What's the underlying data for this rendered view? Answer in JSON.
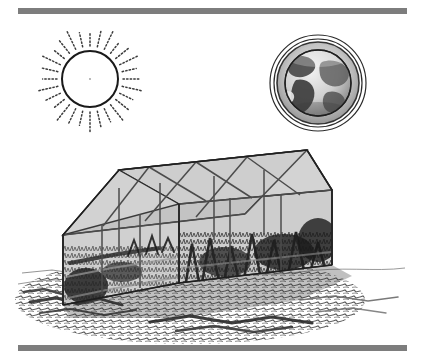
{
  "figure": {
    "caption": "",
    "background_color": "#ffffff",
    "width": 423,
    "height": 363
  },
  "rules": {
    "top_rule": {
      "label": "top-horizontal-rule",
      "color": "#7d7d7d",
      "x": 18,
      "y": 8,
      "width": 389,
      "height": 6
    },
    "bottom_rule": {
      "label": "bottom-horizontal-rule",
      "color": "#7d7d7d",
      "x": 18,
      "y": 345,
      "width": 389,
      "height": 6
    }
  },
  "sun": {
    "label": "Sun",
    "center_x": 90,
    "center_y": 79,
    "radius": 28,
    "outline_color": "#1a1a1a",
    "fill_color": "#ffffff",
    "ray_count": 28,
    "ray_style": "dotted",
    "ray_inner_offset": 5,
    "ray_length": 20,
    "ray_color": "#3a3a3a"
  },
  "earth": {
    "label": "Earth",
    "center_x": 318,
    "center_y": 83,
    "halo_outer_radius": 48,
    "halo_inner_radius": 44,
    "atmosphere_radius": 41,
    "globe_radius": 33,
    "halo_color": "#2b2b2b",
    "atmosphere_color": "#b9b9b9",
    "ocean_color": "#d8d8d8",
    "land_color": "#4a4a4a"
  },
  "greenhouse": {
    "label": "Greenhouse",
    "glass_fill": "#c9c9c9",
    "roof_fill": "#c2c2c2",
    "frame_color": "#4b4b4b",
    "outline_color": "#2a2a2a",
    "ground_color": "#4a4a4a",
    "vegetation_color": "#2e2e2e",
    "front_peak": {
      "x": 119,
      "y": 170
    },
    "rear_peak": {
      "x": 307,
      "y": 150
    },
    "front_left_eave": {
      "x": 63,
      "y": 235
    },
    "front_right_eave": {
      "x": 179,
      "y": 204
    },
    "rear_left_eave": {
      "x": 245,
      "y": 214
    },
    "rear_right_eave": {
      "x": 332,
      "y": 190
    },
    "base_front_left": {
      "x": 63,
      "y": 305
    },
    "base_front_mid": {
      "x": 179,
      "y": 283
    },
    "base_rear_right": {
      "x": 332,
      "y": 265
    },
    "bay_count": 4
  },
  "arrows": [
    {
      "name": "sun-to-earth-ray",
      "description": "Solar radiation travelling from the Sun to the Earth",
      "from_x": 120,
      "from_y": 80,
      "to_x": 277,
      "to_y": 85,
      "head": "none",
      "color": "#1a1a1a"
    },
    {
      "name": "sun-to-greenhouse-ray-left",
      "description": "Solar radiation entering the greenhouse (left)",
      "from_x": 78,
      "from_y": 112,
      "to_x": 108,
      "to_y": 190,
      "head": "arrow",
      "color": "#1a1a1a"
    },
    {
      "name": "sun-to-greenhouse-ray-right",
      "description": "Solar radiation entering the greenhouse (right)",
      "from_x": 116,
      "from_y": 110,
      "to_x": 189,
      "to_y": 167,
      "head": "arrow",
      "color": "#1a1a1a"
    }
  ],
  "ground": {
    "label": "textured-ground",
    "color": "#3f3f3f",
    "horizon_y": 268
  }
}
